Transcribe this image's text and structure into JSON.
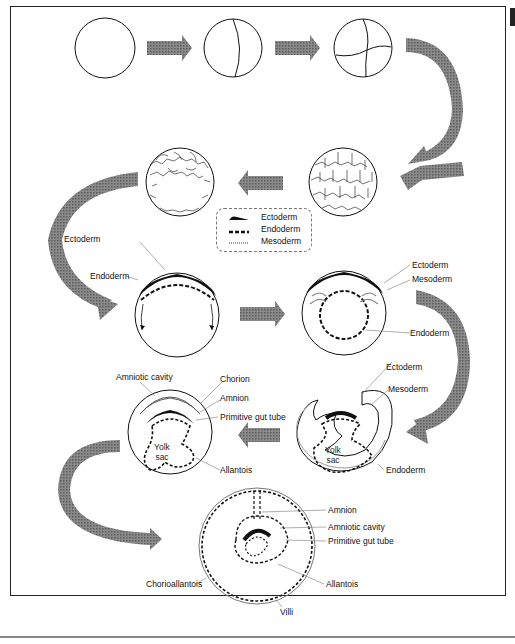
{
  "diagram": {
    "type": "embryonic-development-flow",
    "legend": {
      "items": [
        {
          "label": "Ectoderm",
          "style": "solid-black-wedge"
        },
        {
          "label": "Endoderm",
          "style": "thick-dashed"
        },
        {
          "label": "Mesoderm",
          "style": "thin-double-grey"
        }
      ]
    },
    "stages": [
      {
        "id": "zygote",
        "labels": []
      },
      {
        "id": "two-cell",
        "labels": []
      },
      {
        "id": "four-cell",
        "labels": []
      },
      {
        "id": "morula",
        "labels": []
      },
      {
        "id": "blastula",
        "labels": []
      },
      {
        "id": "gastrula-two-layer",
        "labels": [
          "Ectoderm",
          "Endoderm"
        ]
      },
      {
        "id": "gastrula-three-layer",
        "labels": [
          "Ectoderm",
          "Mesoderm",
          "Endoderm"
        ]
      },
      {
        "id": "folding-embryo",
        "labels": [
          "Ectoderm",
          "Mesoderm",
          "Endoderm",
          "Yolk sac"
        ]
      },
      {
        "id": "amniote-embryo",
        "labels": [
          "Amniotic cavity",
          "Chorion",
          "Amnion",
          "Primitive gut tube",
          "Allantois",
          "Yolk sac"
        ]
      },
      {
        "id": "late-embryo",
        "labels": [
          "Amnion",
          "Amniotic cavity",
          "Primitive gut tube",
          "Allantois",
          "Chorioallantois",
          "Villi"
        ]
      }
    ],
    "labels": {
      "s6_ectoderm": "Ectoderm",
      "s6_endoderm": "Endoderm",
      "s7_ectoderm": "Ectoderm",
      "s7_mesoderm": "Mesoderm",
      "s7_endoderm": "Endoderm",
      "s8_ectoderm": "Ectoderm",
      "s8_mesoderm": "Mesoderm",
      "s8_endoderm": "Endoderm",
      "s8_yolk1": "Yolk",
      "s8_yolk2": "sac",
      "s9_amniotic_cavity": "Amniotic cavity",
      "s9_chorion": "Chorion",
      "s9_amnion": "Amnion",
      "s9_gut": "Primitive gut tube",
      "s9_allantois": "Allantois",
      "s9_yolk1": "Yolk",
      "s9_yolk2": "sac",
      "s10_amnion": "Amnion",
      "s10_amniotic_cavity": "Amniotic cavity",
      "s10_gut": "Primitive gut tube",
      "s10_allantois": "Allantois",
      "s10_chorioallantois": "Chorioallantois",
      "s10_villi": "Villi"
    },
    "colors": {
      "line": "#111111",
      "arrow": "#7a7a7a",
      "mesoderm": "#9a9a9a",
      "frame": "#222222"
    }
  }
}
